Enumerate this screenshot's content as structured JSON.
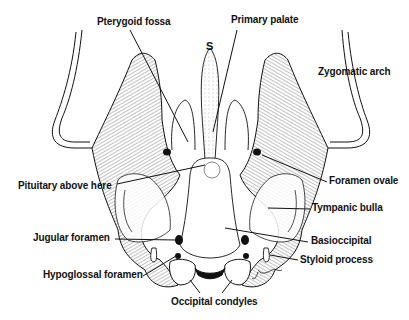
{
  "figure": {
    "ink_color": "#111111",
    "background": "#ffffff",
    "center_marker": "S",
    "signature": "J. Landry"
  },
  "labels": [
    {
      "id": "pterygoid-fossa",
      "text": "Pterygoid fossa",
      "x": 97,
      "y": 16
    },
    {
      "id": "primary-palate",
      "text": "Primary palate",
      "x": 231,
      "y": 14
    },
    {
      "id": "zygomatic-arch",
      "text": "Zygomatic arch",
      "x": 318,
      "y": 66
    },
    {
      "id": "pituitary",
      "text": "Pituitary above here",
      "x": 18,
      "y": 180
    },
    {
      "id": "foramen-ovale",
      "text": "Foramen ovale",
      "x": 329,
      "y": 175
    },
    {
      "id": "tympanic-bulla",
      "text": "Tympanic bulla",
      "x": 312,
      "y": 202
    },
    {
      "id": "basioccipital",
      "text": "Basioccipital",
      "x": 311,
      "y": 235
    },
    {
      "id": "jugular-foramen",
      "text": "Jugular foramen",
      "x": 33,
      "y": 232
    },
    {
      "id": "styloid-process",
      "text": "Styloid process",
      "x": 300,
      "y": 254
    },
    {
      "id": "hypoglossal-foramen",
      "text": "Hypoglossal foramen",
      "x": 43,
      "y": 269
    },
    {
      "id": "occipital-condyles",
      "text": "Occipital condyles",
      "x": 171,
      "y": 296
    }
  ]
}
